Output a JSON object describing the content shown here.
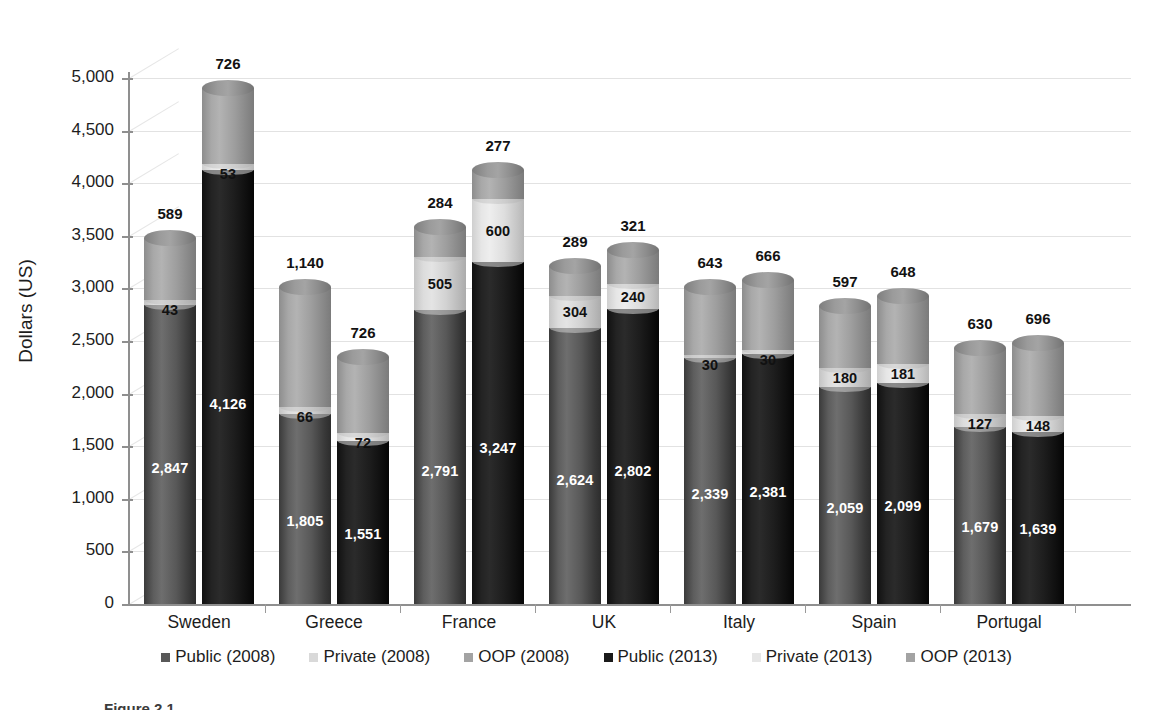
{
  "chart_data": {
    "type": "bar",
    "subtype": "stacked-cylinder-3d",
    "title": "",
    "xlabel": "",
    "ylabel": "Dollars (US)",
    "ylim": [
      0,
      5000
    ],
    "ytick_labels": [
      "0",
      "500",
      "1,000",
      "1,500",
      "2,000",
      "2,500",
      "3,000",
      "3,500",
      "4,000",
      "4,500",
      "5,000"
    ],
    "ytick_values": [
      0,
      500,
      1000,
      1500,
      2000,
      2500,
      3000,
      3500,
      4000,
      4500,
      5000
    ],
    "grid": true,
    "legend_position": "bottom",
    "categories": [
      "Sweden",
      "Greece",
      "France",
      "UK",
      "Italy",
      "Spain",
      "Portugal"
    ],
    "series": [
      {
        "name": "Public (2008)",
        "color": "#585858",
        "values": [
          2847,
          1805,
          2791,
          2624,
          2339,
          2059,
          1679
        ]
      },
      {
        "name": "Private (2008)",
        "color": "#d9d9d9",
        "values": [
          43,
          66,
          505,
          304,
          30,
          180,
          127
        ]
      },
      {
        "name": "OOP (2008)",
        "color": "#a3a3a3",
        "values": [
          589,
          1140,
          284,
          289,
          643,
          597,
          630
        ]
      },
      {
        "name": "Public (2013)",
        "color": "#1a1a1a",
        "values": [
          4126,
          1551,
          3247,
          2802,
          2381,
          2099,
          1639
        ]
      },
      {
        "name": "Private (2013)",
        "color": "#e6e6e6",
        "values": [
          53,
          72,
          600,
          240,
          30,
          181,
          148
        ]
      },
      {
        "name": "OOP (2013)",
        "color": "#a3a3a3",
        "values": [
          726,
          726,
          277,
          321,
          666,
          648,
          696
        ]
      }
    ],
    "bars": [
      {
        "category": "Sweden",
        "year": "2008",
        "public": "2,847",
        "private": "43",
        "oop": "589"
      },
      {
        "category": "Sweden",
        "year": "2013",
        "public": "4,126",
        "private": "53",
        "oop": "726"
      },
      {
        "category": "Greece",
        "year": "2008",
        "public": "1,805",
        "private": "66",
        "oop": "1,140"
      },
      {
        "category": "Greece",
        "year": "2013",
        "public": "1,551",
        "private": "72",
        "oop": "726"
      },
      {
        "category": "France",
        "year": "2008",
        "public": "2,791",
        "private": "505",
        "oop": "284"
      },
      {
        "category": "France",
        "year": "2013",
        "public": "3,247",
        "private": "600",
        "oop": "277"
      },
      {
        "category": "UK",
        "year": "2008",
        "public": "2,624",
        "private": "304",
        "oop": "289"
      },
      {
        "category": "UK",
        "year": "2013",
        "public": "2,802",
        "private": "240",
        "oop": "321"
      },
      {
        "category": "Italy",
        "year": "2008",
        "public": "2,339",
        "private": "30",
        "oop": "643"
      },
      {
        "category": "Italy",
        "year": "2013",
        "public": "2,381",
        "private": "30",
        "oop": "666"
      },
      {
        "category": "Spain",
        "year": "2008",
        "public": "2,059",
        "private": "180",
        "oop": "597"
      },
      {
        "category": "Spain",
        "year": "2013",
        "public": "2,099",
        "private": "181",
        "oop": "648"
      },
      {
        "category": "Portugal",
        "year": "2008",
        "public": "1,679",
        "private": "127",
        "oop": "630"
      },
      {
        "category": "Portugal",
        "year": "2013",
        "public": "1,639",
        "private": "148",
        "oop": "696"
      }
    ]
  },
  "axis": {
    "y_title": "Dollars (US)",
    "ticks": [
      "5,000",
      "4,500",
      "4,000",
      "3,500",
      "3,000",
      "2,500",
      "2,000",
      "1,500",
      "1,000",
      "500",
      "0"
    ]
  },
  "categories": [
    "Sweden",
    "Greece",
    "France",
    "UK",
    "Italy",
    "Spain",
    "Portugal"
  ],
  "legend": [
    {
      "label": "Public (2008)",
      "color": "#585858"
    },
    {
      "label": "Private (2008)",
      "color": "#d9d9d9"
    },
    {
      "label": "OOP (2008)",
      "color": "#a3a3a3"
    },
    {
      "label": "Public (2013)",
      "color": "#1a1a1a"
    },
    {
      "label": "Private (2013)",
      "color": "#e6e6e6"
    },
    {
      "label": "OOP (2013)",
      "color": "#a3a3a3"
    }
  ],
  "caption": "Figure 2.1"
}
